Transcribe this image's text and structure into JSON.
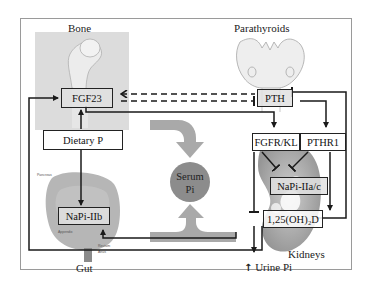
{
  "diagram": {
    "organs": {
      "bone": "Bone",
      "parathyroids": "Parathyroids",
      "gut": "Gut",
      "kidneys": "Kidneys"
    },
    "nodes": {
      "fgf23": "FGF23",
      "pth": "PTH",
      "dietary_p": "Dietary P",
      "napi_iib": "NaPi-IIb",
      "fgfr_kl": "FGFR/KL",
      "pthr1": "PTHR1",
      "napi_iiac": "NaPi-IIa/c",
      "vitd": "1,25(OH)₂D",
      "serum_pi_line1": "Serum",
      "serum_pi_line2": "Pi"
    },
    "outputs": {
      "urine_pi": "Urine Pi",
      "urine_arrow": "↑"
    },
    "colors": {
      "line": "#1a1a1a",
      "serum_circle": "#8c8c8c",
      "big_arrow": "#a9a9a9",
      "bone_bg": "#dcdcdc",
      "frame": "#9a9a9a"
    }
  }
}
